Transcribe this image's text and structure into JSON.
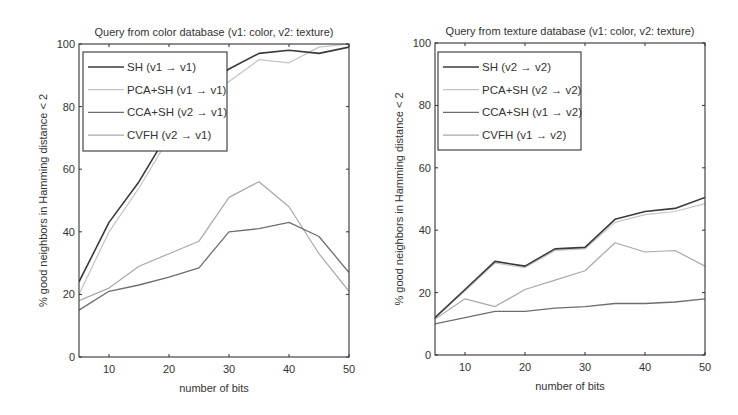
{
  "chart_data": [
    {
      "type": "line",
      "title": "Query from color database (v1: color, v2: texture)",
      "xlabel": "number of bits",
      "ylabel": "% good neighbors in Hamming distance < 2",
      "x": [
        5,
        10,
        15,
        20,
        25,
        30,
        35,
        40,
        45,
        50
      ],
      "xlim": [
        5,
        50
      ],
      "ylim": [
        0,
        100
      ],
      "xticks": [
        10,
        20,
        30,
        40,
        50
      ],
      "yticks": [
        0,
        20,
        40,
        60,
        80,
        100
      ],
      "grid": false,
      "legend_position": "upper left",
      "series": [
        {
          "name": "SH (v1 → v1)",
          "color": "#3a3a3a",
          "width": 1.6,
          "values": [
            24,
            43,
            56,
            72,
            85,
            92,
            97,
            98,
            97,
            99
          ]
        },
        {
          "name": "PCA+SH (v1 → v1)",
          "color": "#c4c4c4",
          "width": 1.2,
          "values": [
            20,
            40,
            54,
            70,
            83,
            88,
            95,
            94,
            99,
            100
          ]
        },
        {
          "name": "CCA+SH (v2 → v1)",
          "color": "#6e6e6e",
          "width": 1.3,
          "values": [
            15,
            21,
            23,
            25.5,
            28.5,
            40,
            41,
            43,
            38.5,
            27
          ]
        },
        {
          "name": "CVFH (v2 → v1)",
          "color": "#a8a8a8",
          "width": 1.2,
          "values": [
            18,
            22,
            29,
            33,
            37,
            51,
            56,
            48,
            33,
            21
          ]
        }
      ]
    },
    {
      "type": "line",
      "title": "Query from texture database (v1: color, v2: texture)",
      "xlabel": "number of bits",
      "ylabel": "% good neighbors in Hamming distance < 2",
      "x": [
        5,
        10,
        15,
        20,
        25,
        30,
        35,
        40,
        45,
        50
      ],
      "xlim": [
        5,
        50
      ],
      "ylim": [
        0,
        100
      ],
      "xticks": [
        10,
        20,
        30,
        40,
        50
      ],
      "yticks": [
        0,
        20,
        40,
        60,
        80,
        100
      ],
      "grid": false,
      "legend_position": "upper left",
      "series": [
        {
          "name": "SH (v2 → v2)",
          "color": "#3a3a3a",
          "width": 1.6,
          "values": [
            12,
            21,
            30,
            28.5,
            34,
            34.5,
            43.5,
            46,
            47,
            50.5
          ]
        },
        {
          "name": "PCA+SH (v2 → v2)",
          "color": "#c4c4c4",
          "width": 1.2,
          "values": [
            12,
            20.5,
            29.5,
            28,
            33.5,
            34,
            42.5,
            45,
            46,
            48.5
          ]
        },
        {
          "name": "CCA+SH (v1 → v2)",
          "color": "#6e6e6e",
          "width": 1.3,
          "values": [
            10,
            12,
            14,
            14,
            15,
            15.5,
            16.5,
            16.5,
            17,
            18
          ]
        },
        {
          "name": "CVFH (v1 → v2)",
          "color": "#a8a8a8",
          "width": 1.2,
          "values": [
            11.5,
            18,
            15.5,
            21,
            24,
            27,
            36,
            33,
            33.5,
            28.5
          ]
        }
      ]
    }
  ],
  "layout": {
    "panels": [
      {
        "left": 79,
        "right": 349,
        "top": 44,
        "bottom": 357,
        "legend": {
          "x": 83,
          "y": 52,
          "w": 144,
          "h": 99
        }
      },
      {
        "left": 435,
        "right": 705,
        "top": 43,
        "bottom": 355,
        "legend": {
          "x": 438,
          "y": 52,
          "w": 143,
          "h": 98
        }
      }
    ]
  }
}
